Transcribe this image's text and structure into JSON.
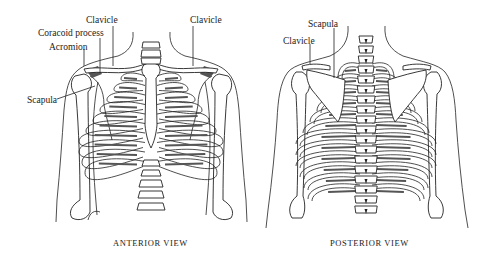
{
  "figure": {
    "panels": [
      {
        "id": "anterior",
        "caption": "ANTERIOR VIEW",
        "labels": [
          {
            "text": "Clavicle",
            "target": "left-clavicle"
          },
          {
            "text": "Clavicle",
            "target": "right-clavicle"
          },
          {
            "text": "Coracoid process",
            "target": "coracoid-process"
          },
          {
            "text": "Acromion",
            "target": "acromion"
          },
          {
            "text": "Scapula",
            "target": "scapula"
          }
        ]
      },
      {
        "id": "posterior",
        "caption": "POSTERIOR VIEW",
        "labels": [
          {
            "text": "Scapula",
            "target": "scapula"
          },
          {
            "text": "Clavicle",
            "target": "clavicle"
          }
        ]
      }
    ]
  }
}
